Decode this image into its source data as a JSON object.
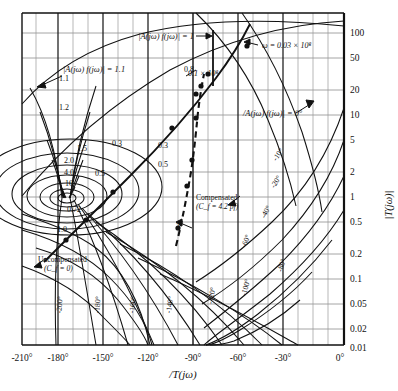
{
  "figure": {
    "kind": "nichols-chart",
    "background": "#ffffff",
    "line_color": "#1a1a1a",
    "grid_color": "#9a9a9a",
    "axis_color": "#000000"
  },
  "axes": {
    "x_axis_label": "/T(jω)",
    "y_axis_label": "|T(jω)|",
    "x_ticks": [
      "-210°",
      "-180°",
      "-150°",
      "-120°",
      "-90°",
      "-60°",
      "-30°",
      "0°"
    ],
    "x_tick_values": [
      -210,
      -180,
      -150,
      -120,
      -90,
      -60,
      -30,
      0
    ],
    "x_minor_step_deg": 10,
    "x_range": [
      -215,
      0
    ],
    "y_ticks": [
      "100",
      "50",
      "20",
      "10",
      "5",
      "2",
      "1",
      "0.5",
      "0.2",
      "0.1",
      "0.05",
      "0.02",
      "0.01"
    ],
    "y_tick_values": [
      100,
      50,
      20,
      10,
      5,
      2,
      1,
      0.5,
      0.2,
      0.1,
      0.05,
      0.02,
      0.01
    ],
    "y_range": [
      0.01,
      200
    ]
  },
  "annotations": {
    "mag_unity": "|A(jω) f(jω)| = 1",
    "mag_1p1": "|A(jω) f(jω)| = 1.1",
    "phase_zero": "/A(jω) f(jω)| = 0°",
    "omega_top": "ω = 0.03 × 10⁸",
    "omega_mid": "0.1 × 10⁸",
    "uncompensated_l1": "Uncompensated",
    "uncompensated_l2": "(C_f = 0)",
    "compensated_l1": "Compensated",
    "compensated_l2": "(C_f = 4.2 pf)"
  },
  "mag_contour_labels": [
    {
      "text": "1.1",
      "x": 64,
      "y": 81
    },
    {
      "text": "1.2",
      "x": 64,
      "y": 110
    },
    {
      "text": "1.5",
      "x": 82,
      "y": 151
    },
    {
      "text": "2.0",
      "x": 69,
      "y": 163
    },
    {
      "text": "4.0",
      "x": 69,
      "y": 175
    },
    {
      "text": "10",
      "x": 69,
      "y": 186
    },
    {
      "text": "0.72",
      "x": 74,
      "y": 212
    },
    {
      "text": "1.0",
      "x": 62,
      "y": 232
    },
    {
      "text": "0.3",
      "x": 117,
      "y": 146
    },
    {
      "text": "0.5",
      "x": 100,
      "y": 176
    },
    {
      "text": "0.3",
      "x": 163,
      "y": 148
    },
    {
      "text": "0.5",
      "x": 163,
      "y": 167
    },
    {
      "text": "0.8",
      "x": 189,
      "y": 72
    },
    {
      "text": "2",
      "x": 178,
      "y": 229
    }
  ],
  "phase_contour_labels": [
    {
      "text": "-10°",
      "x": 280,
      "y": 156,
      "rot": -55
    },
    {
      "text": "-20°",
      "x": 278,
      "y": 183,
      "rot": -58
    },
    {
      "text": "-40°",
      "x": 268,
      "y": 213,
      "rot": -62
    },
    {
      "text": "-60°",
      "x": 248,
      "y": 242,
      "rot": -68
    },
    {
      "text": "-80°",
      "x": 284,
      "y": 266,
      "rot": -72
    },
    {
      "text": "-100°",
      "x": 248,
      "y": 288,
      "rot": -76
    },
    {
      "text": "-120°",
      "x": 214,
      "y": 296,
      "rot": -80
    },
    {
      "text": "-140°",
      "x": 172,
      "y": 305,
      "rot": -82
    },
    {
      "text": "-160°",
      "x": 135,
      "y": 305,
      "rot": -84
    },
    {
      "text": "-180°",
      "x": 100,
      "y": 305,
      "rot": -86
    },
    {
      "text": "-200°",
      "x": 62,
      "y": 305,
      "rot": -86
    }
  ],
  "curves": {
    "uncompensated": {
      "name": "Uncompensated (C_f = 0)",
      "style": "solid",
      "markers": [
        "1.0",
        "0.72",
        "0.3",
        "0.8"
      ]
    },
    "compensated": {
      "name": "Compensated (C_f = 4.2 pf)",
      "style": "dashed",
      "markers": [
        "2",
        "0.5",
        "0.3"
      ]
    }
  }
}
